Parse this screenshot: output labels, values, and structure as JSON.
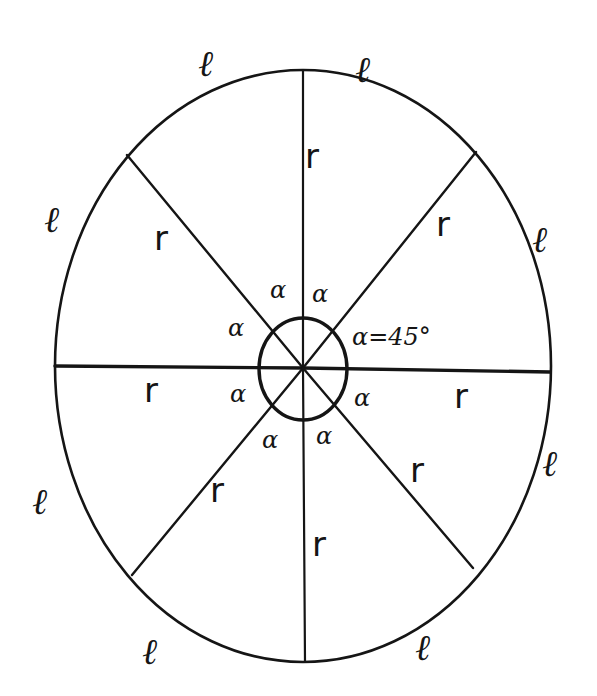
{
  "diagram": {
    "type": "circle-sector-diagram",
    "stroke_color": "#151515",
    "background": "#ffffff",
    "labels": {
      "arc": "ℓ",
      "radius": "r",
      "angle": "α",
      "angle_value": "α=45°"
    },
    "arc_labels": [
      {
        "text": "ℓ",
        "x": 205,
        "y": 75
      },
      {
        "text": "ℓ",
        "x": 365,
        "y": 80
      },
      {
        "text": "ℓ",
        "x": 52,
        "y": 225
      },
      {
        "text": "ℓ",
        "x": 540,
        "y": 245
      },
      {
        "text": "ℓ",
        "x": 545,
        "y": 470
      },
      {
        "text": "ℓ",
        "x": 38,
        "y": 508
      },
      {
        "text": "ℓ",
        "x": 148,
        "y": 660
      },
      {
        "text": "ℓ",
        "x": 422,
        "y": 656
      }
    ],
    "radius_labels": [
      {
        "text": "r",
        "x": 305,
        "y": 165
      },
      {
        "text": "r",
        "x": 156,
        "y": 247
      },
      {
        "text": "r",
        "x": 437,
        "y": 232
      },
      {
        "text": "r",
        "x": 147,
        "y": 400
      },
      {
        "text": "r",
        "x": 454,
        "y": 405
      },
      {
        "text": "r",
        "x": 211,
        "y": 500
      },
      {
        "text": "r",
        "x": 412,
        "y": 480
      },
      {
        "text": "r",
        "x": 312,
        "y": 553
      }
    ],
    "angle_labels": [
      {
        "text": "α",
        "x": 274,
        "y": 296
      },
      {
        "text": "α",
        "x": 313,
        "y": 301
      },
      {
        "text": "α",
        "x": 233,
        "y": 333
      },
      {
        "text": "α",
        "x": 234,
        "y": 400
      },
      {
        "text": "α",
        "x": 355,
        "y": 404
      },
      {
        "text": "α",
        "x": 264,
        "y": 446
      },
      {
        "text": "α",
        "x": 318,
        "y": 443
      }
    ],
    "angle_annotation": {
      "text": "α=45°",
      "x": 354,
      "y": 342
    }
  }
}
